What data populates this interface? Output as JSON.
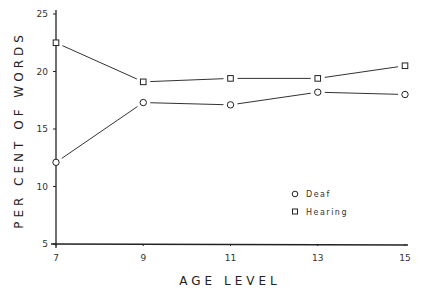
{
  "chart_data": {
    "type": "line",
    "title": "",
    "xlabel": "AGE LEVEL",
    "ylabel": "PER CENT OF WORDS",
    "x": [
      7,
      9,
      11,
      13,
      15
    ],
    "xticks": [
      "7",
      "9",
      "11",
      "13",
      "15"
    ],
    "yticks": [
      "5",
      "10",
      "15",
      "20",
      "25"
    ],
    "ylim": [
      5,
      25
    ],
    "xlim": [
      7,
      15
    ],
    "grid": false,
    "legend_position": "lower right (inside plot)",
    "series": [
      {
        "name": "Deaf",
        "marker": "circle",
        "values": [
          12.1,
          17.3,
          17.1,
          18.2,
          18.0
        ]
      },
      {
        "name": "Hearing",
        "marker": "square",
        "values": [
          22.5,
          19.1,
          19.4,
          19.4,
          20.5
        ]
      }
    ]
  },
  "legend": {
    "deaf": "Deaf",
    "hearing": "Hearing"
  },
  "axes": {
    "xlabel": "AGE LEVEL",
    "ylabel": "PER CENT OF WORDS"
  }
}
